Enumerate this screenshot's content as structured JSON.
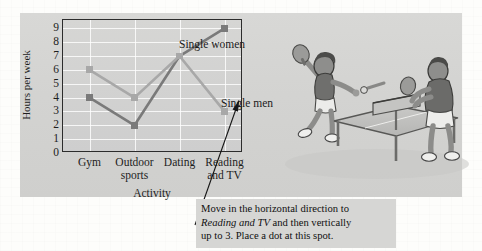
{
  "chart_data": {
    "type": "line",
    "title": "",
    "xlabel": "Activity",
    "ylabel": "Hours per week",
    "categories": [
      "Gym",
      "Outdoor sports",
      "Dating",
      "Reading and TV"
    ],
    "category_lines": [
      [
        "Gym"
      ],
      [
        "Outdoor",
        "sports"
      ],
      [
        "Dating"
      ],
      [
        "Reading",
        "and TV"
      ]
    ],
    "series": [
      {
        "name": "Single women",
        "values": [
          4,
          2,
          7,
          9
        ],
        "color": "#7a7a7a"
      },
      {
        "name": "Single men",
        "values": [
          6,
          4,
          7,
          3
        ],
        "color": "#a8a8a8"
      }
    ],
    "yticks": [
      9,
      8,
      7,
      6,
      5,
      4,
      3,
      2,
      1,
      0
    ],
    "ylim": [
      0,
      9.6
    ],
    "grid": true,
    "legend_position": "inline-labels",
    "marker": "square",
    "annotations": [
      {
        "id": "callout",
        "text_line_1": "Move in the horizontal direction to",
        "text_line_2_italic": "Reading and TV",
        "text_line_2_rest": " and then vertically",
        "text_line_3": "up to 3. Place a dot at this spot.",
        "points_to": {
          "category": "Reading and TV",
          "value": 3
        }
      }
    ]
  },
  "chart": {
    "ylabel": "Hours per week",
    "xlabel": "Activity",
    "yticks": [
      "9",
      "8",
      "7",
      "6",
      "5",
      "4",
      "3",
      "2",
      "1",
      "0"
    ],
    "series_labels": {
      "women": "Single women",
      "men": "Single men"
    }
  },
  "annotation": {
    "line1": "Move in the horizontal direction to",
    "line2_italic": "Reading and TV",
    "line2_rest": " and then vertically",
    "line3": "up to 3. Place a dot at this spot."
  },
  "illustration": {
    "name": "table-tennis-players-illustration",
    "alt": "Two people playing table tennis"
  }
}
